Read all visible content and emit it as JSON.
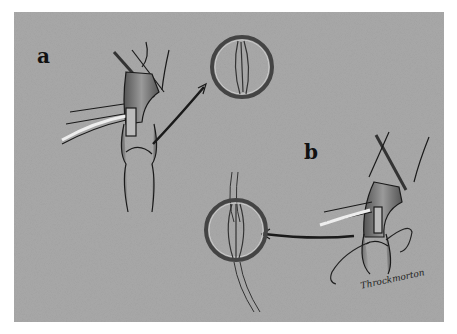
{
  "figure": {
    "panel_labels": {
      "a": "a",
      "b": "b"
    },
    "signature": "Throckmorton",
    "colors": {
      "background": "#a9a9a9",
      "ink": "#1a1a1a",
      "vessel_fill": "#8c8c8c",
      "highlight": "#e6e6e6"
    }
  }
}
